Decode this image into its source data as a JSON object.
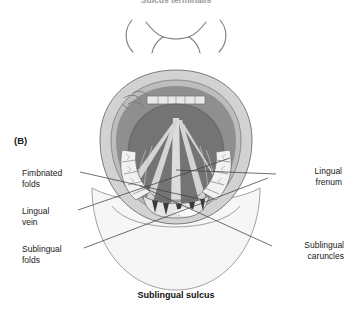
{
  "figure": {
    "panel_marker": "(B)",
    "top_title": "Sulcus terminalis",
    "caption": "Sublingual sulcus"
  },
  "labels": {
    "left": [
      {
        "id": "fimbriated-folds",
        "text": "Fimbriated\nfolds"
      },
      {
        "id": "lingual-vein",
        "text": "Lingual\nvein"
      },
      {
        "id": "sublingual-folds",
        "text": "Sublingual\nfolds"
      }
    ],
    "right": [
      {
        "id": "lingual-frenum",
        "text": "Lingual\nfrenum"
      },
      {
        "id": "sublingual-caruncles",
        "text": "Sublingual\ncaruncles"
      }
    ]
  },
  "colors": {
    "background": "#ffffff",
    "text": "#1a1a1a",
    "leader_line": "#4a4a4a",
    "outline": "#6b6b6b",
    "lip": "#cfcfcf",
    "lip_inner": "#b9b9b9",
    "oral_cavity": "#8c8c8c",
    "tongue_under": "#7a7a7a",
    "tongue_dark": "#6a6a6a",
    "vein_light": "#d8d8d8",
    "tooth": "#f2f2f2",
    "tooth_shade": "#d6d6d6",
    "mandible": "#f4f4f4",
    "arch_line": "#7c7c7c"
  }
}
